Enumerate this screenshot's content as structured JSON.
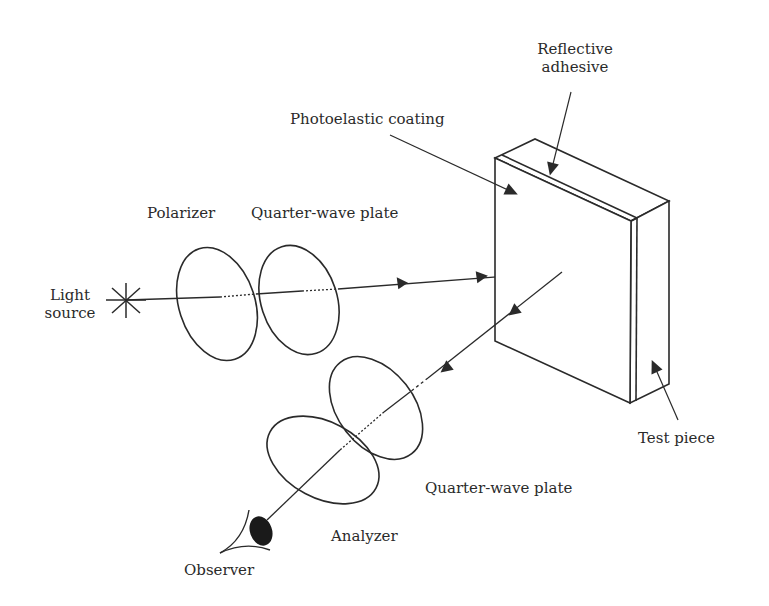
{
  "diagram": {
    "labels": {
      "light_source_line1": "Light",
      "light_source_line2": "source",
      "polarizer": "Polarizer",
      "quarter_wave_plate_1": "Quarter-wave plate",
      "photoelastic_coating": "Photoelastic coating",
      "reflective_adhesive_line1": "Reflective",
      "reflective_adhesive_line2": "adhesive",
      "test_piece": "Test piece",
      "quarter_wave_plate_2": "Quarter-wave plate",
      "analyzer": "Analyzer",
      "observer": "Observer"
    },
    "colors": {
      "stroke": "#2a2a2a",
      "background": "#ffffff"
    }
  }
}
